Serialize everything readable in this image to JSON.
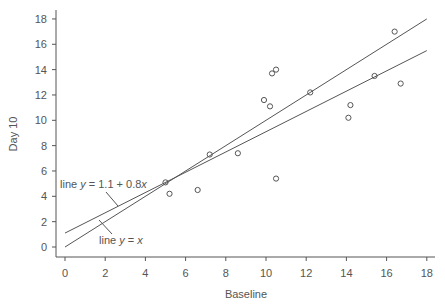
{
  "chart_data": {
    "type": "scatter",
    "title": "",
    "xlabel": "Baseline",
    "ylabel": "Day 10",
    "xlim": [
      0,
      18
    ],
    "ylim": [
      0,
      18
    ],
    "xticks": [
      0,
      2,
      4,
      6,
      8,
      10,
      12,
      14,
      16,
      18
    ],
    "yticks": [
      0,
      2,
      4,
      6,
      8,
      10,
      12,
      14,
      16,
      18
    ],
    "grid": false,
    "legend": null,
    "series": [
      {
        "name": "observations",
        "marker": "open-circle",
        "points": [
          [
            5.0,
            5.1
          ],
          [
            5.2,
            4.2
          ],
          [
            6.6,
            4.5
          ],
          [
            7.2,
            7.3
          ],
          [
            8.6,
            7.4
          ],
          [
            9.9,
            11.6
          ],
          [
            10.2,
            11.1
          ],
          [
            10.3,
            13.7
          ],
          [
            10.5,
            14.0
          ],
          [
            10.5,
            5.4
          ],
          [
            12.2,
            12.2
          ],
          [
            14.1,
            10.2
          ],
          [
            14.2,
            11.2
          ],
          [
            15.4,
            13.5
          ],
          [
            16.4,
            17.0
          ],
          [
            16.7,
            12.9
          ]
        ]
      }
    ],
    "lines": [
      {
        "name": "line y = x",
        "intercept": 0,
        "slope": 1,
        "x_range": [
          0,
          18
        ]
      },
      {
        "name": "line y = 1.1 + 0.8x",
        "intercept": 1.1,
        "slope": 0.8,
        "x_range": [
          0,
          18
        ]
      }
    ],
    "annotations": [
      {
        "text_prefix": "line ",
        "var": "y",
        "text_suffix": " = 1.1 + 0.8",
        "tail_var": "x"
      },
      {
        "text_prefix": "line ",
        "var": "y",
        "text_suffix": " = ",
        "tail_var": "x"
      }
    ]
  },
  "colors": {
    "axis": "#555555",
    "line": "#555555",
    "marker": "#555555",
    "text": "#555555"
  }
}
